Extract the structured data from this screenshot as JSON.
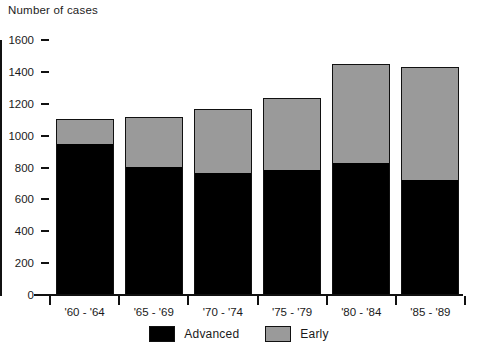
{
  "chart_data": {
    "type": "bar",
    "subtype": "stacked-bar",
    "title": "Number of cases",
    "xlabel": "",
    "ylabel": "Number of cases",
    "ylim": [
      0,
      1600
    ],
    "yticks": [
      0,
      200,
      400,
      600,
      800,
      1000,
      1200,
      1400,
      1600
    ],
    "ytick_labels": [
      "0",
      "200",
      "400",
      "600",
      "800",
      "1000",
      "1200",
      "1400",
      "1600"
    ],
    "grid": false,
    "legend_position": "bottom-center",
    "categories": [
      "'60 - '64",
      "'65 - '69",
      "'70 - '74",
      "'75 - '79",
      "'80 - '84",
      "'85 - '89"
    ],
    "series": [
      {
        "name": "Advanced",
        "color": "#000000",
        "values": [
          950,
          810,
          770,
          790,
          830,
          725
        ]
      },
      {
        "name": "Early",
        "color": "#9a9a9a",
        "values": [
          155,
          305,
          400,
          445,
          620,
          705
        ]
      }
    ],
    "totals": [
      1105,
      1115,
      1170,
      1235,
      1450,
      1430
    ]
  },
  "chart": {
    "axis_title": "Number of cases"
  },
  "legend": {
    "items": [
      {
        "label": "Advanced",
        "swatch": "black-square-swatch"
      },
      {
        "label": "Early",
        "swatch": "gray-square-swatch"
      }
    ]
  },
  "colors": {
    "advanced": "#000000",
    "early": "#9a9a9a",
    "axis": "#111111",
    "text": "#1a1a1a",
    "background": "#ffffff"
  }
}
